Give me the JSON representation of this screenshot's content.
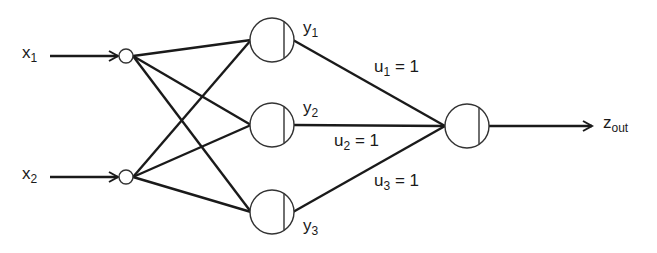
{
  "diagram": {
    "type": "neural-network",
    "inputs": [
      {
        "id": "x1",
        "base": "x",
        "sub": "1"
      },
      {
        "id": "x2",
        "base": "x",
        "sub": "2"
      }
    ],
    "hidden": [
      {
        "id": "y1",
        "base": "y",
        "sub": "1"
      },
      {
        "id": "y2",
        "base": "y",
        "sub": "2"
      },
      {
        "id": "y3",
        "base": "y",
        "sub": "3"
      }
    ],
    "weights": [
      {
        "base": "u",
        "sub": "1",
        "value": "= 1"
      },
      {
        "base": "u",
        "sub": "2",
        "value": "= 1"
      },
      {
        "base": "u",
        "sub": "3",
        "value": "= 1"
      }
    ],
    "output": {
      "base": "z",
      "sub": "out"
    },
    "colors": {
      "stroke": "#1a1a1a",
      "background": "#ffffff"
    }
  }
}
